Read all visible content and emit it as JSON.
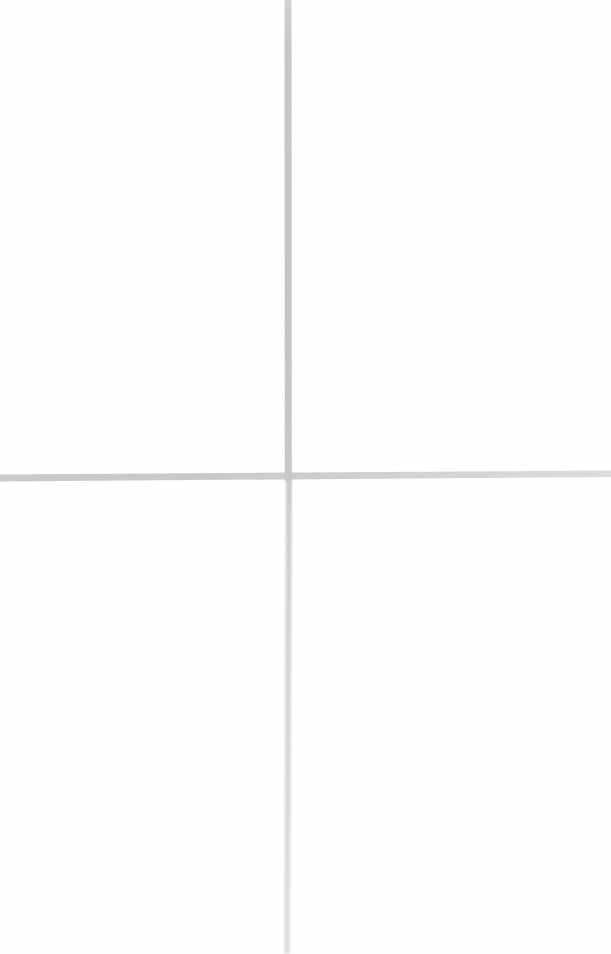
{
  "page": {
    "width": 611,
    "height": 954,
    "background_color": "#ffffff",
    "description": "A large light-gray cross / crosshair drawn on a blank white page."
  },
  "figure": {
    "type": "crosshair",
    "intersection": {
      "x": 288,
      "y": 477
    },
    "ink_color": "#c9cbcc",
    "ink_color_light": "#dcdedf",
    "ink_color_dark": "#bfc2c4",
    "strokes": [
      {
        "name": "vertical-stroke-upper",
        "orientation": "vertical",
        "x_center": 288,
        "y_start": 0,
        "y_end": 477,
        "thickness": 7,
        "tone": "#c4c7c9",
        "note": "darker and slightly thicker than the lower segment"
      },
      {
        "name": "vertical-stroke-lower",
        "orientation": "vertical",
        "x_center": 289,
        "y_start": 477,
        "y_end": 954,
        "thickness": 6,
        "tone": "#d2d4d6",
        "note": "lighter, fades toward the bottom edge, leans very slightly left"
      },
      {
        "name": "horizontal-stroke",
        "orientation": "horizontal",
        "x_start": 0,
        "x_end": 611,
        "y_left": 478,
        "y_right": 474,
        "thickness": 6,
        "tone": "#cdcfd1",
        "note": "spans full width, tilts up slightly to the right, fades at the right end"
      }
    ]
  }
}
